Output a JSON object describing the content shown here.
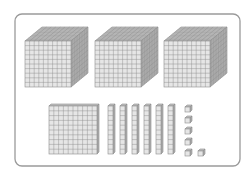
{
  "diagram": {
    "title": "Base-ten blocks",
    "represented_number": "3166",
    "colors": {
      "frame": "#9a9a9a",
      "grid_line": "#8c8c8c",
      "front_fill": "#e6e6e6",
      "top_fill": "#c4c4c4",
      "side_fill": "#b0b0b0",
      "background": "#ffffff"
    },
    "frame": {
      "x": 15,
      "y": 14,
      "width": 225,
      "height": 152,
      "radius": 7
    },
    "thousands": {
      "label": "Thousand cubes",
      "count": 3,
      "items": [
        {
          "x": 25,
          "y": 41,
          "size": 46
        },
        {
          "x": 95,
          "y": 41,
          "size": 46
        },
        {
          "x": 164,
          "y": 41,
          "size": 46
        }
      ],
      "grid": 10,
      "depth_dx": 17,
      "depth_dy": 14
    },
    "hundreds": {
      "label": "Hundred flats",
      "count": 1,
      "items": [
        {
          "x": 49,
          "y": 106,
          "size": 48
        }
      ],
      "grid": 10,
      "depth_dx": 2,
      "depth_dy": 2
    },
    "tens": {
      "label": "Ten rods",
      "count": 6,
      "items": [
        {
          "x": 108,
          "y": 106
        },
        {
          "x": 120,
          "y": 106
        },
        {
          "x": 132,
          "y": 106
        },
        {
          "x": 144,
          "y": 106
        },
        {
          "x": 156,
          "y": 106
        },
        {
          "x": 168,
          "y": 106
        }
      ],
      "width": 5,
      "height": 48,
      "grid": 10,
      "depth_dx": 2,
      "depth_dy": 2
    },
    "ones": {
      "label": "Unit cubes",
      "count": 6,
      "items": [
        {
          "x": 185,
          "y": 107
        },
        {
          "x": 185,
          "y": 118
        },
        {
          "x": 185,
          "y": 129
        },
        {
          "x": 185,
          "y": 140
        },
        {
          "x": 185,
          "y": 151
        },
        {
          "x": 198,
          "y": 151
        }
      ],
      "size": 5,
      "depth_dx": 2,
      "depth_dy": 2
    }
  }
}
